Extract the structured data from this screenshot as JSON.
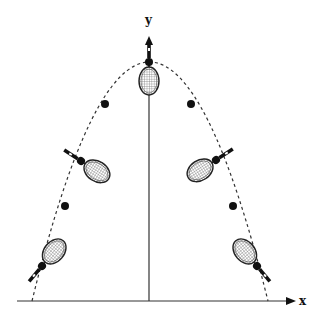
{
  "figure": {
    "axes": {
      "x_label": "x",
      "y_label": "y"
    },
    "colors": {
      "line": "#111111",
      "background": "#ffffff"
    },
    "trajectory": {
      "style": "dashed",
      "shape": "parabola",
      "apex": [
        149,
        62
      ],
      "base_left": [
        32,
        301
      ],
      "base_right": [
        268,
        301
      ]
    },
    "center_of_mass_points": [
      [
        42,
        266
      ],
      [
        65,
        206
      ],
      [
        81,
        161
      ],
      [
        105,
        104
      ],
      [
        149,
        62
      ],
      [
        191,
        104
      ],
      [
        216,
        160
      ],
      [
        233,
        206
      ],
      [
        257,
        266
      ]
    ],
    "rackets": [
      {
        "name": "racket-bottom-left",
        "com": [
          42,
          266
        ],
        "angle": 35
      },
      {
        "name": "racket-mid-left",
        "com": [
          81,
          161
        ],
        "angle": -55
      },
      {
        "name": "racket-top",
        "com": [
          149,
          62
        ],
        "angle": 0
      },
      {
        "name": "racket-mid-right",
        "com": [
          216,
          160
        ],
        "angle": 55
      },
      {
        "name": "racket-bottom-right",
        "com": [
          257,
          266
        ],
        "angle": -35
      }
    ]
  }
}
